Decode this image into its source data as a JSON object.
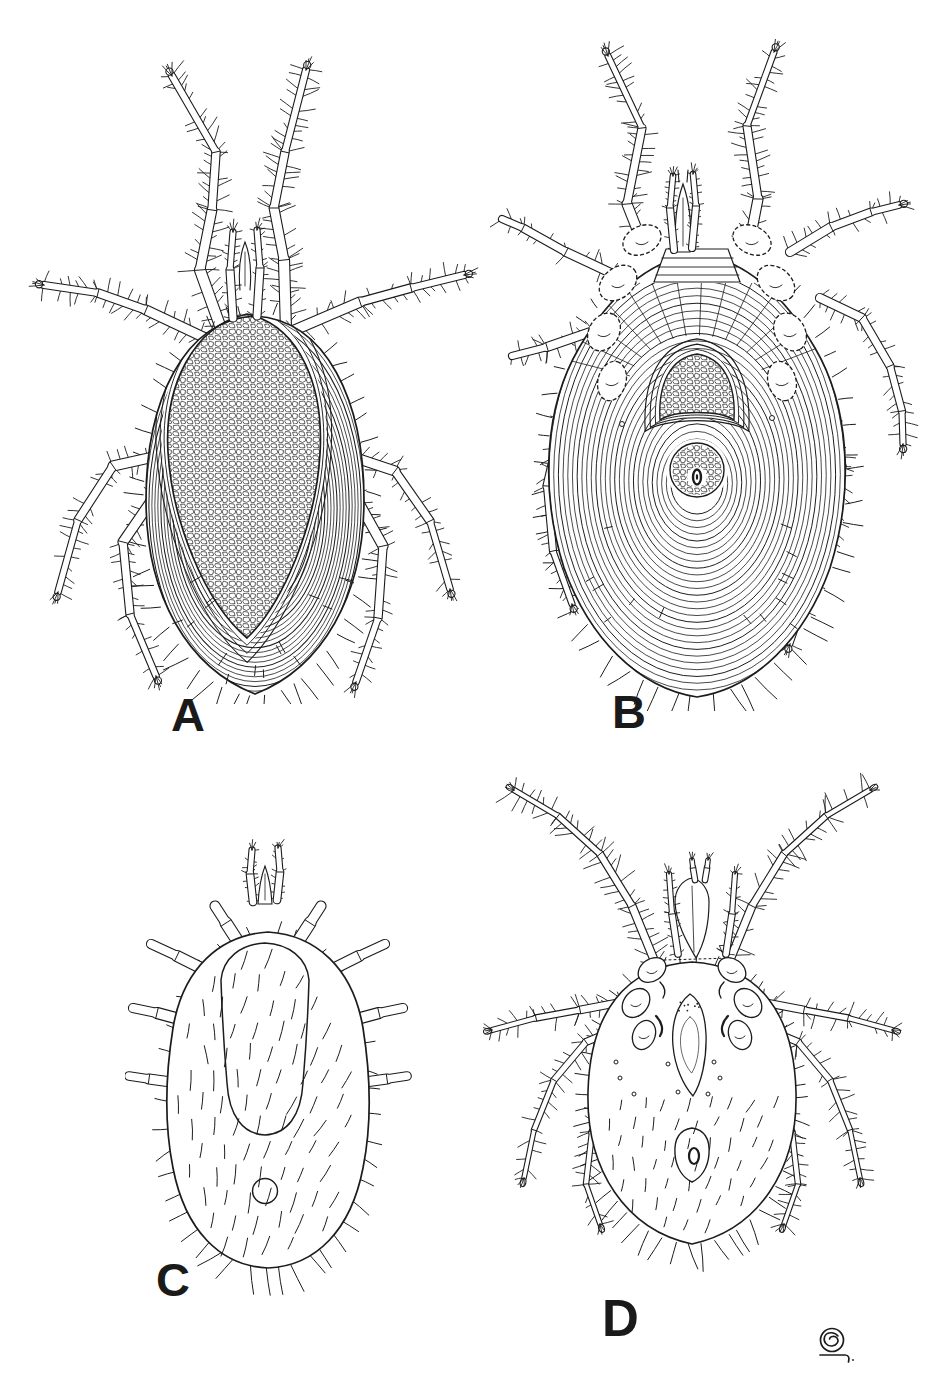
{
  "figure": {
    "ink_color": "#1c1c1c",
    "paper_color": "#ffffff",
    "panels": [
      {
        "id": "A",
        "label": "A",
        "depicts": "mite dorsal view with reticulate dorsal shield, striated integument and eight hairy legs"
      },
      {
        "id": "B",
        "label": "B",
        "depicts": "mite ventral view with striated venter, coxae, genital dome and anal shield"
      },
      {
        "id": "C",
        "label": "C",
        "depicts": "engorged larval mite dorsal view, oval body covered with setae, stub legs"
      },
      {
        "id": "D",
        "label": "D",
        "depicts": "mite ventral view with long slender legs, sternal shield and genital plate"
      }
    ],
    "monogram": {
      "icon": "artist-monogram-icon",
      "glyph": "circled-e with underline flourish"
    }
  }
}
